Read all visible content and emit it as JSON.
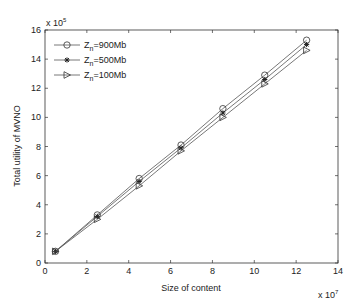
{
  "chart_data": {
    "type": "line",
    "title": "",
    "xlabel": "Size of content",
    "ylabel": "Total utility of MVNO",
    "x_multiplier": "x 10^7",
    "y_multiplier": "x 10^5",
    "x_exp_base": "x 10",
    "x_exp": "7",
    "y_exp_base": "x 10",
    "y_exp": "5",
    "xlim": [
      0,
      14
    ],
    "ylim": [
      0,
      16
    ],
    "xticks": [
      0,
      2,
      4,
      6,
      8,
      10,
      12,
      14
    ],
    "yticks": [
      0,
      2,
      4,
      6,
      8,
      10,
      12,
      14,
      16
    ],
    "grid": false,
    "legend_position": "upper left",
    "x": [
      0.5,
      2.5,
      4.5,
      6.5,
      8.5,
      10.5,
      12.5
    ],
    "series": [
      {
        "name": "Z_n=900Mb",
        "label_main": "Z",
        "label_sub": "n",
        "label_rest": "=900Mb",
        "marker": "circle",
        "values": [
          0.8,
          3.3,
          5.8,
          8.1,
          10.6,
          12.9,
          15.3
        ]
      },
      {
        "name": "Z_n=500Mb",
        "label_main": "Z",
        "label_sub": "n",
        "label_rest": "=500Mb",
        "marker": "star",
        "values": [
          0.8,
          3.2,
          5.6,
          7.9,
          10.3,
          12.6,
          15.0
        ]
      },
      {
        "name": "Z_n=100Mb",
        "label_main": "Z",
        "label_sub": "n",
        "label_rest": "=100Mb",
        "marker": "triangle-right",
        "values": [
          0.8,
          3.0,
          5.3,
          7.7,
          10.0,
          12.3,
          14.6
        ]
      }
    ]
  },
  "colors": {
    "axis": "#333333",
    "line": "#555555",
    "marker_fill": "#ffffff",
    "star_color": "#222222"
  }
}
